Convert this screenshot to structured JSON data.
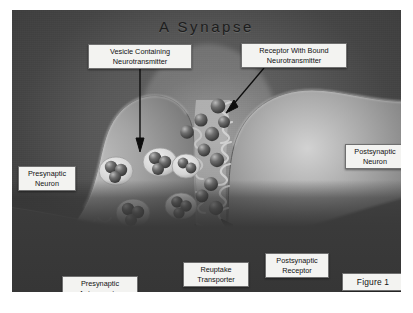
{
  "figure": {
    "title": "A Synapse",
    "caption_label": "Figure 1",
    "background_color": "#4d4d4d",
    "neuron_color": "#8a8a8a",
    "callout_bg": "#f3f3f1",
    "callout_border": "#6f6f6f"
  },
  "labels": {
    "vesicle": "Vesicle Containing\nNeurotransmitter",
    "receptor_bound": "Receptor With Bound\nNeurotransmitter",
    "presynaptic_neuron": "Presynaptic\nNeuron",
    "postsynaptic_neuron": "Postsynaptic\nNeuron",
    "presynaptic_autoreceptor": "Presynaptic\nAutoreceptor",
    "reuptake_transporter": "Reuptake\nTransporter",
    "postsynaptic_receptor": "Postsynaptic\nReceptor"
  },
  "icons": {
    "leader_arrow": "arrow-pointer-line",
    "neurotransmitter": "sphere-molecule",
    "vesicle": "vesicle-sac",
    "receptor": "receptor-prong"
  }
}
